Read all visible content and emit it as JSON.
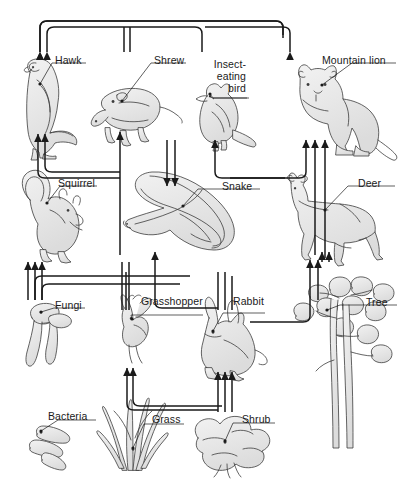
{
  "diagram": {
    "type": "food-web",
    "title": "",
    "background_color": "#ffffff",
    "line_color": "#1a1a1a",
    "organism_fill": "#e8e8e8",
    "organism_stroke": "#444444",
    "labels": {
      "hawk": "Hawk",
      "shrew": "Shrew",
      "insect_eating_bird_l1": "Insect-",
      "insect_eating_bird_l2": "eating",
      "insect_eating_bird_l3": "bird",
      "mountain_lion": "Mountain lion",
      "squirrel": "Squirrel",
      "snake": "Snake",
      "deer": "Deer",
      "fungi": "Fungi",
      "grasshopper": "Grasshopper",
      "rabbit": "Rabbit",
      "tree": "Tree",
      "bacteria": "Bacteria",
      "grass": "Grass",
      "shrub": "Shrub"
    },
    "organisms": [
      {
        "id": "hawk",
        "label": "Hawk",
        "row": 1,
        "x": 48,
        "y": 100
      },
      {
        "id": "shrew",
        "label": "Shrew",
        "row": 1,
        "x": 131,
        "y": 105
      },
      {
        "id": "insect-bird",
        "label": "Insect-eating bird",
        "row": 1,
        "x": 224,
        "y": 108
      },
      {
        "id": "mountain-lion",
        "label": "Mountain lion",
        "row": 1,
        "x": 330,
        "y": 105
      },
      {
        "id": "squirrel",
        "label": "Squirrel",
        "row": 2,
        "x": 55,
        "y": 215
      },
      {
        "id": "snake",
        "label": "Snake",
        "row": 2,
        "x": 200,
        "y": 220
      },
      {
        "id": "deer",
        "label": "Deer",
        "row": 2,
        "x": 330,
        "y": 215
      },
      {
        "id": "fungi",
        "label": "Fungi",
        "row": 3,
        "x": 62,
        "y": 330
      },
      {
        "id": "grasshopper",
        "label": "Grasshopper",
        "row": 3,
        "x": 131,
        "y": 330
      },
      {
        "id": "rabbit",
        "label": "Rabbit",
        "row": 3,
        "x": 222,
        "y": 335
      },
      {
        "id": "tree",
        "label": "Tree",
        "row": 3,
        "x": 335,
        "y": 355
      },
      {
        "id": "bacteria",
        "label": "Bacteria",
        "row": 4,
        "x": 68,
        "y": 440
      },
      {
        "id": "grass",
        "label": "Grass",
        "row": 4,
        "x": 130,
        "y": 435
      },
      {
        "id": "shrub",
        "label": "Shrub",
        "row": 4,
        "x": 225,
        "y": 440
      }
    ],
    "arrow_count_notes": {
      "into_hawk": 2,
      "into_shrew": 1,
      "into_insect_bird": 1,
      "into_mountain_lion": 3,
      "into_squirrel_area_fungi": 3,
      "into_snake": 1,
      "into_deer": 2,
      "into_top_hawk_from_right": 2,
      "into_mountain_lion_top": 1,
      "into_grass_consumers": 2,
      "into_shrub_consumers": 3
    }
  }
}
